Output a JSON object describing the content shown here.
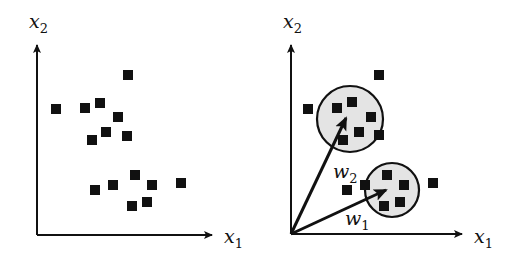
{
  "panels": [
    {
      "id": "left",
      "x_axis_label": "x",
      "x_axis_sub": "1",
      "y_axis_label": "x",
      "y_axis_sub": "2",
      "origin": [
        37,
        235
      ],
      "y_axis_top": [
        37,
        45
      ],
      "x_axis_end": [
        212,
        235
      ],
      "points": [
        [
          56,
          109
        ],
        [
          85,
          108
        ],
        [
          100,
          103
        ],
        [
          118,
          117
        ],
        [
          92,
          140
        ],
        [
          106,
          132
        ],
        [
          127,
          136
        ],
        [
          128,
          75
        ],
        [
          95,
          190
        ],
        [
          113,
          185
        ],
        [
          135,
          175
        ],
        [
          152,
          185
        ],
        [
          181,
          183
        ],
        [
          132,
          206
        ],
        [
          147,
          202
        ]
      ]
    },
    {
      "id": "right",
      "x_axis_label": "x",
      "x_axis_sub": "1",
      "y_axis_label": "x",
      "y_axis_sub": "2",
      "origin": [
        291,
        234
      ],
      "y_axis_top": [
        291,
        45
      ],
      "x_axis_end": [
        462,
        234
      ],
      "clusters": [
        {
          "center": [
            350,
            119
          ],
          "radius": 33,
          "fill": "#e4e4e4"
        },
        {
          "center": [
            392,
            190
          ],
          "radius": 27,
          "fill": "#e4e4e4"
        }
      ],
      "vectors": [
        {
          "label": "w",
          "sub": "2",
          "tip": [
            346,
            118
          ],
          "label_pos": [
            333,
            178
          ]
        },
        {
          "label": "w",
          "sub": "1",
          "tip": [
            386,
            190
          ],
          "label_pos": [
            345,
            225
          ]
        }
      ],
      "points": [
        [
          308,
          109
        ],
        [
          337,
          108
        ],
        [
          352,
          102
        ],
        [
          371,
          117
        ],
        [
          359,
          132
        ],
        [
          343,
          140
        ],
        [
          379,
          75
        ],
        [
          379,
          135
        ],
        [
          347,
          190
        ],
        [
          365,
          185
        ],
        [
          387,
          175
        ],
        [
          404,
          185
        ],
        [
          433,
          183
        ],
        [
          384,
          206
        ],
        [
          400,
          202
        ]
      ]
    }
  ],
  "colors": {
    "ink": "#111111",
    "cluster_fill": "#e4e4e4"
  }
}
